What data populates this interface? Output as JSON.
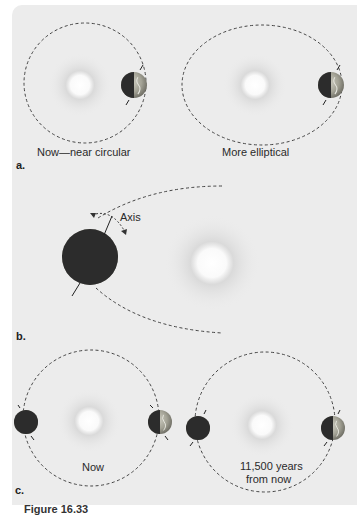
{
  "figure": {
    "panels": [
      {
        "letter": "a.",
        "labels": [
          "Now—near circular",
          "More elliptical"
        ]
      },
      {
        "letter": "b.",
        "labels": [
          "Axis"
        ]
      },
      {
        "letter": "c.",
        "labels": [
          "Now",
          "11,500 years",
          "from now"
        ]
      }
    ],
    "caption_partial": "Figure 16.33"
  },
  "colors": {
    "panel_background": "#ececec",
    "orbit_dash": "#444444",
    "earth_land": "#9a9a8a",
    "earth_night": "#2c2c2c"
  }
}
